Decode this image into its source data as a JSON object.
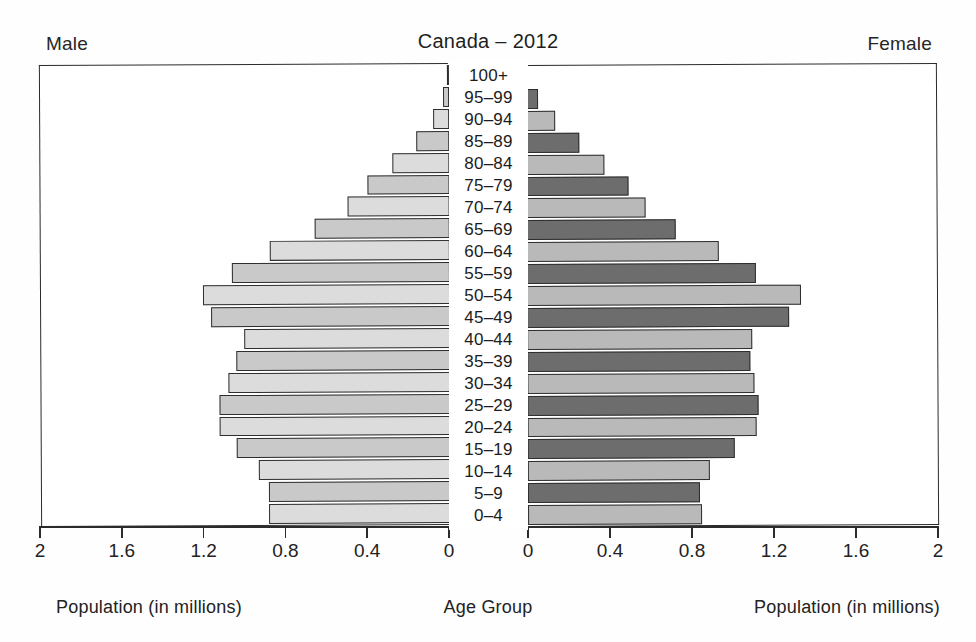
{
  "header": {
    "title": "Canada – 2012",
    "male_label": "Male",
    "female_label": "Female"
  },
  "captions": {
    "left": "Population (in millions)",
    "center": "Age Group",
    "right": "Population (in millions)"
  },
  "axis": {
    "left_ticks": [
      "2",
      "1.6",
      "1.2",
      "0.8",
      "0.4",
      "0"
    ],
    "right_ticks": [
      "0",
      "0.4",
      "0.8",
      "1.2",
      "1.6",
      "2"
    ],
    "max": 2,
    "step": 0.4
  },
  "colors": {
    "male_light": "#dcdcdc",
    "male_medium": "#c9c9c9",
    "female_light": "#b9b9b9",
    "female_dark": "#6d6d6d",
    "outline": "#2e2e2e",
    "frame": "#2b2b2b",
    "background": "#ffffff"
  },
  "chart_data": {
    "type": "bar",
    "title": "Canada – 2012",
    "subtitle": "",
    "xlabel": "Population (in millions)",
    "ylabel": "Age Group",
    "orientation": "horizontal",
    "layout": "population-pyramid",
    "grid": false,
    "legend": "none",
    "xlim": [
      0,
      2
    ],
    "xticks": [
      0,
      0.4,
      0.8,
      1.2,
      1.6,
      2
    ],
    "categories": [
      "100+",
      "95–99",
      "90–94",
      "85–89",
      "80–84",
      "75–79",
      "70–74",
      "65–69",
      "60–64",
      "55–59",
      "50–54",
      "45–49",
      "40–44",
      "35–39",
      "30–34",
      "25–29",
      "20–24",
      "15–19",
      "10–14",
      "5–9",
      "0–4"
    ],
    "series": [
      {
        "name": "Male",
        "side": "left",
        "values": [
          0.01,
          0.03,
          0.08,
          0.16,
          0.28,
          0.4,
          0.5,
          0.66,
          0.88,
          1.07,
          1.21,
          1.17,
          1.01,
          1.05,
          1.09,
          1.13,
          1.13,
          1.05,
          0.94,
          0.89,
          0.89
        ]
      },
      {
        "name": "Female",
        "side": "right",
        "values": [
          0.01,
          0.06,
          0.14,
          0.26,
          0.38,
          0.5,
          0.58,
          0.73,
          0.94,
          1.12,
          1.34,
          1.28,
          1.1,
          1.09,
          1.11,
          1.13,
          1.12,
          1.01,
          0.89,
          0.84,
          0.85
        ]
      }
    ]
  }
}
